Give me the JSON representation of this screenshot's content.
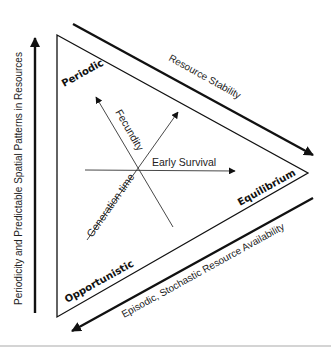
{
  "diagram": {
    "corners": {
      "top": "Periodic",
      "right": "Equilibrium",
      "bottom": "Opportunistic"
    },
    "axes": {
      "fecundity": "Fecundity",
      "early_survival": "Early Survival",
      "generation_time": "Generation time"
    },
    "gradients": {
      "vertical": "Periodicity and Predictable Spatial Patterns in Resources",
      "upper_diagonal": "Resource Stability",
      "lower_diagonal": "Episodic, Stochastic Resource Availability"
    },
    "colors": {
      "line": "#111111",
      "thin_line": "#333333",
      "rule": "#d4d4d4"
    }
  }
}
